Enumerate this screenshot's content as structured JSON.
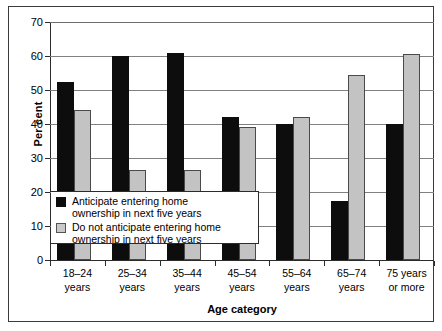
{
  "chart_data": {
    "type": "bar",
    "title": "",
    "xlabel": "Age category",
    "ylabel": "Per cent",
    "ylim": [
      0,
      70
    ],
    "yticks": [
      0,
      10,
      20,
      30,
      40,
      50,
      60,
      70
    ],
    "ytick_labels": [
      "0",
      "10",
      "20",
      "30",
      "40",
      "50",
      "60",
      "70"
    ],
    "grid": true,
    "legend_position": "inside-lower-left",
    "categories": [
      "18–24 years",
      "25–34 years",
      "35–44 years",
      "45–54 years",
      "55–64 years",
      "65–74 years",
      "75 years or more"
    ],
    "category_lines": [
      [
        "18–24",
        "years"
      ],
      [
        "25–34",
        "years"
      ],
      [
        "35–44",
        "years"
      ],
      [
        "45–54",
        "years"
      ],
      [
        "55–64",
        "years"
      ],
      [
        "65–74",
        "years"
      ],
      [
        "75 years",
        "or more"
      ]
    ],
    "series": [
      {
        "name": "Anticipate entering home ownership in next five years",
        "color": "#0d0d0d",
        "values": [
          52.5,
          60,
          61,
          42,
          40,
          17.5,
          40
        ]
      },
      {
        "name": "Do not anticipate entering home ownership in next five years",
        "color": "#c3c3c3",
        "values": [
          44,
          26.5,
          26.5,
          39,
          42,
          54.5,
          60.5
        ]
      }
    ]
  },
  "legend": {
    "items": [
      {
        "swatch": "black",
        "line1": "Anticipate entering home",
        "line2": "ownership in next five years"
      },
      {
        "swatch": "grey",
        "line1": "Do not anticipate entering home",
        "line2": "ownership in next five years"
      }
    ]
  }
}
